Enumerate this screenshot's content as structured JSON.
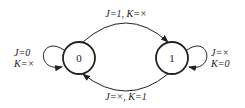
{
  "diagram": {
    "type": "state-diagram",
    "title": "",
    "states": [
      {
        "id": "s0",
        "label": "0"
      },
      {
        "id": "s1",
        "label": "1"
      }
    ],
    "transitions": [
      {
        "from": "0",
        "to": "0",
        "label_line1": "J=0",
        "label_line2": "K=×"
      },
      {
        "from": "0",
        "to": "1",
        "label": "J=1, K=×"
      },
      {
        "from": "1",
        "to": "1",
        "label_line1": "J=×",
        "label_line2": "K=0"
      },
      {
        "from": "1",
        "to": "0",
        "label": "J=×, K=1"
      }
    ],
    "colors": {
      "stroke": "#222222",
      "background": "#ffffff"
    }
  }
}
